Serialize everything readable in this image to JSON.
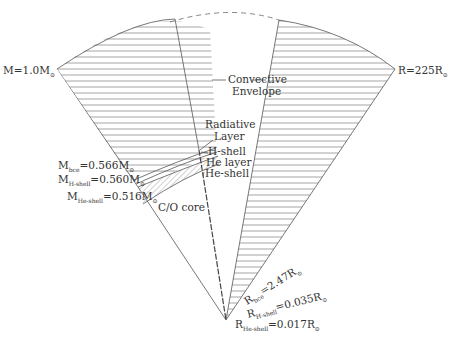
{
  "diagram": {
    "title": "",
    "center": {
      "x": 226,
      "y": 320
    },
    "mass_labels": [
      {
        "id": "total",
        "prefix": "M",
        "subscript": "",
        "value": "=1.0M",
        "unit_sub": "⊙"
      },
      {
        "id": "bce",
        "prefix": "M",
        "subscript": "bce",
        "value": "=0.566M",
        "unit_sub": "⊙"
      },
      {
        "id": "h_shell",
        "prefix": "M",
        "subscript": "H-shell",
        "value": "=0.560M",
        "unit_sub": "⊙"
      },
      {
        "id": "he_shell",
        "prefix": "M",
        "subscript": "He-shell",
        "value": "=0.516M",
        "unit_sub": "⊙"
      }
    ],
    "radius_labels": [
      {
        "id": "total",
        "prefix": "R",
        "subscript": "",
        "value": "=225R",
        "unit_sub": "⊙"
      },
      {
        "id": "bce",
        "prefix": "R",
        "subscript": "bce",
        "value": "=2.47R",
        "unit_sub": "⊙"
      },
      {
        "id": "h_shell",
        "prefix": "R",
        "subscript": "H-shell",
        "value": "=0.035R",
        "unit_sub": "⊙"
      },
      {
        "id": "he_shell",
        "prefix": "R",
        "subscript": "He-shell",
        "value": "=0.017R",
        "unit_sub": "⊙"
      }
    ],
    "region_labels": {
      "convective_line1": "Convective",
      "convective_line2": "Envelope",
      "radiative_line1": "Radiative",
      "radiative_line2": "Layer",
      "h_shell": "H-shell",
      "he_layer": "He layer",
      "he_shell": "He-shell",
      "core": "C/O core"
    }
  }
}
